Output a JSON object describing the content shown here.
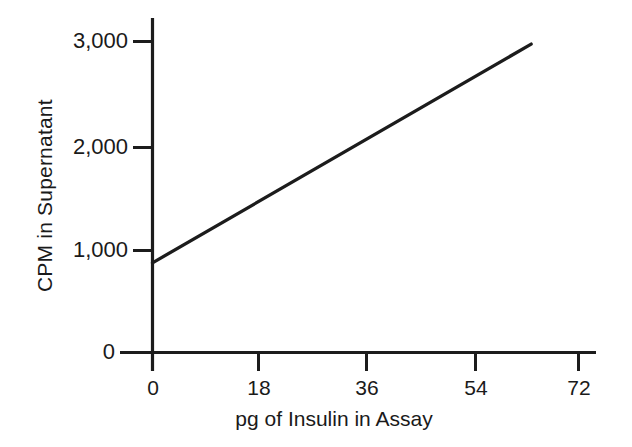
{
  "chart_data": {
    "type": "line",
    "title": "",
    "xlabel": "pg of Insulin in Assay",
    "ylabel": "CPM in Supernatant",
    "xlim": [
      0,
      72
    ],
    "ylim": [
      0,
      3000
    ],
    "xticks": [
      0,
      18,
      36,
      54,
      72
    ],
    "yticks": [
      0,
      1000,
      2000,
      3000
    ],
    "xtick_labels": [
      "0",
      "18",
      "36",
      "54",
      "72"
    ],
    "ytick_labels": [
      "0",
      "1,000",
      "2,000",
      "3,000"
    ],
    "grid": false,
    "legend": null,
    "series": [
      {
        "name": "standard curve",
        "x": [
          0,
          64
        ],
        "values": [
          865,
          2975
        ],
        "color": "#1c1c1c"
      }
    ],
    "annotations": []
  },
  "axes": {
    "y_tick_labels": [
      {
        "value": 3000,
        "text": "3,000"
      },
      {
        "value": 2000,
        "text": "2,000"
      },
      {
        "value": 1000,
        "text": "1,000"
      },
      {
        "value": 0,
        "text": "0"
      }
    ],
    "x_tick_labels": [
      {
        "value": 0,
        "text": "0"
      },
      {
        "value": 18,
        "text": "18"
      },
      {
        "value": 36,
        "text": "36"
      },
      {
        "value": 54,
        "text": "54"
      },
      {
        "value": 72,
        "text": "72"
      }
    ],
    "x_axis_title": "pg of Insulin in Assay",
    "y_axis_title": "CPM in Supernatant"
  },
  "style": {
    "background": "#ffffff",
    "ink": "#1c1c1c"
  }
}
